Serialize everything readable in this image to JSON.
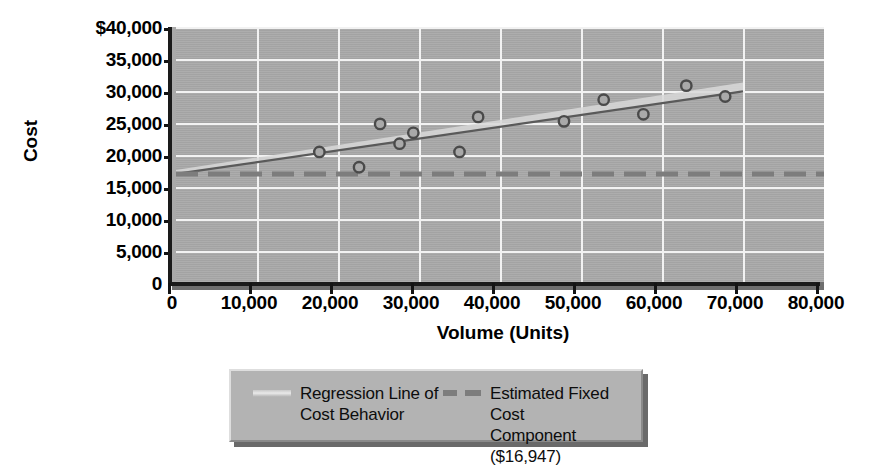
{
  "chart_data": {
    "type": "scatter",
    "title": "",
    "xlabel": "Volume (Units)",
    "ylabel": "Cost",
    "xlim": [
      0,
      80000
    ],
    "ylim": [
      0,
      40000
    ],
    "grid": true,
    "x_ticks": [
      "0",
      "10,000",
      "20,000",
      "30,000",
      "40,000",
      "50,000",
      "60,000",
      "70,000",
      "80,000"
    ],
    "x_tick_values": [
      0,
      10000,
      20000,
      30000,
      40000,
      50000,
      60000,
      70000,
      80000
    ],
    "y_ticks": [
      "0",
      "5,000",
      "10,000",
      "15,000",
      "20,000",
      "25,000",
      "30,000",
      "35,000",
      "$40,000"
    ],
    "y_tick_values": [
      0,
      5000,
      10000,
      15000,
      20000,
      25000,
      30000,
      35000,
      40000
    ],
    "series": [
      {
        "name": "Observed Cost Points",
        "type": "scatter",
        "points": [
          {
            "x": 17700,
            "y": 20400
          },
          {
            "x": 22600,
            "y": 18000
          },
          {
            "x": 25200,
            "y": 24800
          },
          {
            "x": 27600,
            "y": 21700
          },
          {
            "x": 29300,
            "y": 23400
          },
          {
            "x": 35000,
            "y": 20400
          },
          {
            "x": 37300,
            "y": 25900
          },
          {
            "x": 47900,
            "y": 25200
          },
          {
            "x": 52800,
            "y": 28600
          },
          {
            "x": 57700,
            "y": 26300
          },
          {
            "x": 63000,
            "y": 30800
          },
          {
            "x": 67800,
            "y": 29100
          }
        ]
      },
      {
        "name": "Regression Line of Cost Behavior",
        "type": "line",
        "points": [
          {
            "x": 0,
            "y": 16947
          },
          {
            "x": 70000,
            "y": 29900
          }
        ]
      },
      {
        "name": "Estimated Fixed Cost Component ($16,947)",
        "type": "line",
        "style": "dashed",
        "points": [
          {
            "x": 0,
            "y": 16947
          },
          {
            "x": 80000,
            "y": 16947
          }
        ]
      }
    ],
    "legend_position": "bottom",
    "legend": [
      {
        "label": "Regression Line of\nCost Behavior",
        "swatch": "solid-line-swatch"
      },
      {
        "label": "Estimated Fixed Cost\nComponent ($16,947)",
        "swatch": "dashed-line-swatch"
      }
    ],
    "annotations": {
      "fixed_cost_value": "$16,947"
    }
  },
  "colors": {
    "plot_background": "#a9a9a9",
    "gridline": "#f2f2f2",
    "axis": "#141414",
    "marker_stroke": "#4a4a4a",
    "regression_line": "#5a5a5a",
    "regression_highlight": "#d8d8d8",
    "fixed_cost_line": "#7d7d7d",
    "legend_background": "#b3b3b3",
    "page_background": "#ffffff"
  }
}
